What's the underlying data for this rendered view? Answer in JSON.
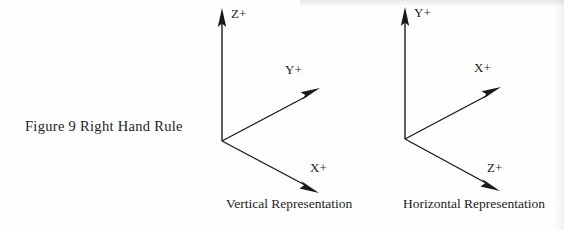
{
  "figure": {
    "caption": "Figure 9  Right Hand Rule"
  },
  "diagrams": [
    {
      "name": "vertical-representation",
      "caption": "Vertical Representation",
      "axes": [
        {
          "id": "up",
          "label": "Z+",
          "direction": "up"
        },
        {
          "id": "up-right",
          "label": "Y+",
          "direction": "up-right"
        },
        {
          "id": "down-right",
          "label": "X+",
          "direction": "down-right"
        }
      ]
    },
    {
      "name": "horizontal-representation",
      "caption": "Horizontal Representation",
      "axes": [
        {
          "id": "up",
          "label": "Y+",
          "direction": "up"
        },
        {
          "id": "up-right",
          "label": "X+",
          "direction": "up-right"
        },
        {
          "id": "down-right",
          "label": "Z+",
          "direction": "down-right"
        }
      ]
    }
  ],
  "style": {
    "ink_color": "#1a1a1a",
    "background_color": "#fefefe"
  }
}
